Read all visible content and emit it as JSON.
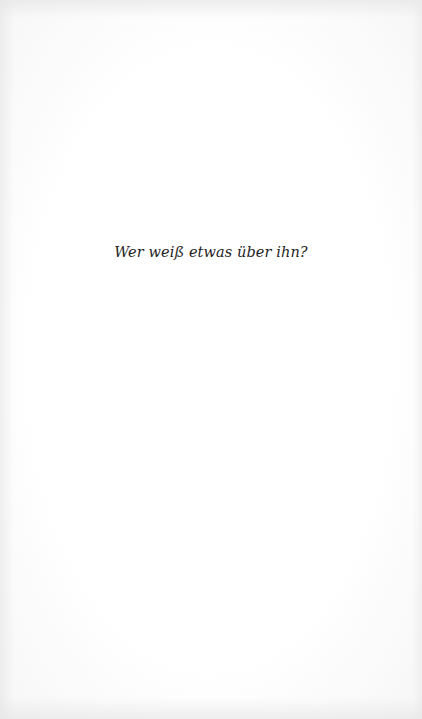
{
  "page": {
    "text_lines": [
      "Wer weiß etwas über ihn?"
    ]
  }
}
